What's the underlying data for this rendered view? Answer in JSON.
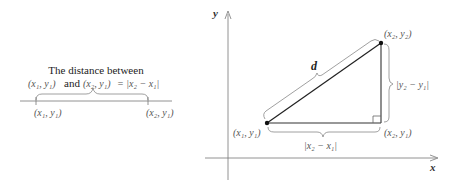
{
  "left_diagram": {
    "title_line1": "The distance between",
    "title_line2_a": "(x₁, y₁)",
    "title_line2_and": "and",
    "title_line2_b": "(x₂, y₁)",
    "title_line2_eq": "= |x₂ − x₁|",
    "point1_label": "(x₁, y₁)",
    "point2_label": "(x₂, y₁)"
  },
  "right_diagram": {
    "y_axis_label": "y",
    "x_axis_label": "x",
    "hypotenuse_label": "d",
    "top_point_label": "(x₂, y₂)",
    "bottom_left_point_label": "(x₁, y₁)",
    "bottom_right_point_label": "(x₂, y₁)",
    "vertical_distance_label": "|y₂ − y₁|",
    "horizontal_distance_label": "|x₂ − x₁|"
  }
}
